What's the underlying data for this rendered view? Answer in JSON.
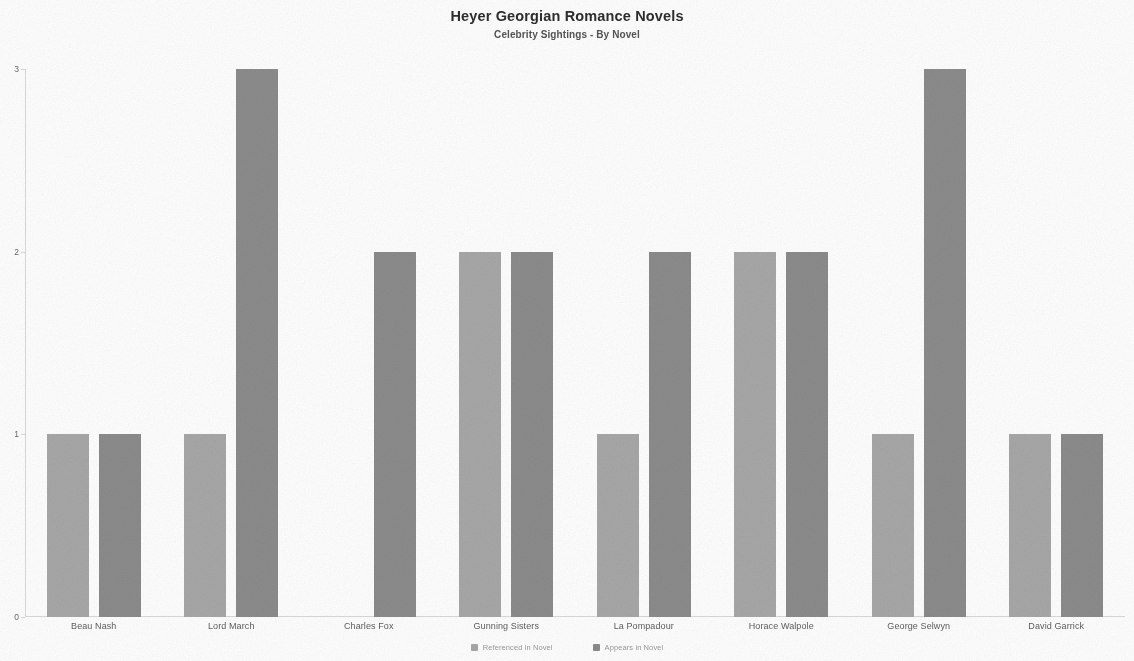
{
  "header": {
    "title": "Heyer Georgian Romance Novels",
    "subtitle": "Celebrity Sightings - By Novel"
  },
  "legend": {
    "items": [
      {
        "label": "Referenced in Novel",
        "color": "#a8a8a8"
      },
      {
        "label": "Appears in Novel",
        "color": "#8c8c8c"
      }
    ]
  },
  "axis": {
    "y_ticks": [
      "0",
      "1",
      "2",
      "3"
    ]
  },
  "chart_data": {
    "type": "bar",
    "title": "Heyer Georgian Romance Novels",
    "subtitle": "Celebrity Sightings - By Novel",
    "xlabel": "",
    "ylabel": "",
    "ylim": [
      0,
      3
    ],
    "yticks": [
      0,
      1,
      2,
      3
    ],
    "grid": false,
    "legend_position": "bottom-center",
    "grouping": "grouped",
    "categories": [
      "Beau Nash",
      "Lord March",
      "Charles Fox",
      "Gunning Sisters",
      "La Pompadour",
      "Horace Walpole",
      "George Selwyn",
      "David Garrick"
    ],
    "series": [
      {
        "name": "Referenced in Novel",
        "color": "#a8a8a8",
        "values": [
          1,
          1,
          0,
          2,
          1,
          2,
          1,
          1
        ]
      },
      {
        "name": "Appears in Novel",
        "color": "#8c8c8c",
        "values": [
          1,
          3,
          2,
          2,
          2,
          2,
          3,
          1
        ]
      }
    ]
  }
}
